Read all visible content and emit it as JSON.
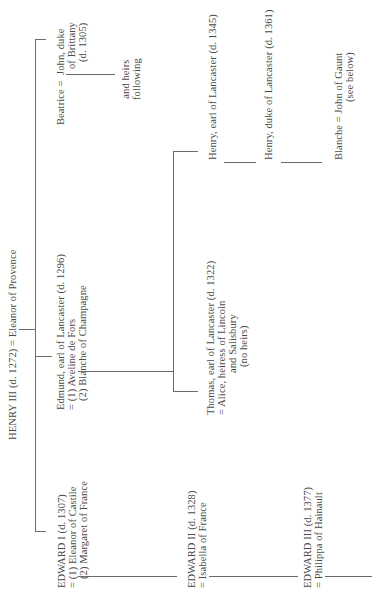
{
  "tree": {
    "root": {
      "line": "HENRY III (d. 1272) = Eleanor of Provence"
    },
    "beatrice": {
      "name": "Beatrice =",
      "spouse_lines": [
        "John, duke",
        "of Brittany",
        "(d. 1305)"
      ],
      "issue_lines": [
        "and heirs",
        "following"
      ]
    },
    "edmund": {
      "lines": [
        "Edmund, earl of Lancaster (d. 1296)",
        "= (1) Aveline de Fors",
        "(2) Blanche of Champagne"
      ]
    },
    "thomas": {
      "lines": [
        "Thomas, earl of Lancaster (d. 1322)",
        "= Alice, heiress of Lincoln",
        "and Salisbury",
        "(no heirs)"
      ]
    },
    "henry_earl": {
      "line": "Henry, earl of Lancaster (d. 1345)"
    },
    "henry_duke": {
      "line": "Henry, duke of Lancaster (d. 1361)"
    },
    "blanche": {
      "line": "Blanche = John of Gaunt",
      "note": "(see below)"
    },
    "edward1": {
      "lines": [
        "EDWARD I (d. 1307)",
        "= (1) Eleanor of Castile",
        "(2) Margaret of France"
      ]
    },
    "edward2": {
      "lines": [
        "EDWARD II (d. 1328)",
        "= Isabella of France"
      ]
    },
    "edward3": {
      "lines": [
        "EDWARD III (d. 1377)",
        "= Philippa of Hainault"
      ]
    }
  },
  "style": {
    "text_color": "#4a4a4a",
    "line_color": "#6a6a6a",
    "orientation": "rotated 90 degrees counter-clockwise"
  }
}
